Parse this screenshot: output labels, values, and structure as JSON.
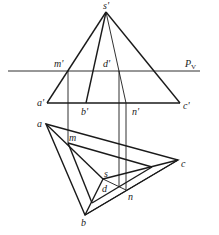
{
  "diagram": {
    "type": "descriptive-geometry-projection",
    "labels": {
      "s_prime": "s'",
      "m_prime": "m'",
      "d_prime": "d'",
      "pv": "P",
      "pv_sub": "V",
      "a_prime": "a'",
      "b_prime": "b'",
      "n_prime": "n'",
      "c_prime": "c'",
      "a": "a",
      "m": "m",
      "c": "c",
      "s": "s",
      "d": "d",
      "n": "n",
      "b": "b"
    },
    "points": {
      "front_view": {
        "s'": [
          106,
          12
        ],
        "a'": [
          47,
          103
        ],
        "b'": [
          86,
          103
        ],
        "c'": [
          180,
          103
        ],
        "m'": [
          68,
          71
        ],
        "d'": [
          119,
          71
        ],
        "n'": [
          126,
          103
        ]
      },
      "top_view": {
        "a": [
          46,
          124
        ],
        "b": [
          85,
          215
        ],
        "c": [
          178,
          160
        ],
        "s": [
          103,
          179
        ],
        "m": [
          68,
          143
        ],
        "d": [
          119,
          187
        ],
        "n": [
          126,
          190
        ]
      }
    },
    "pv_line": {
      "x1": 8,
      "x2": 200,
      "y": 71
    }
  }
}
